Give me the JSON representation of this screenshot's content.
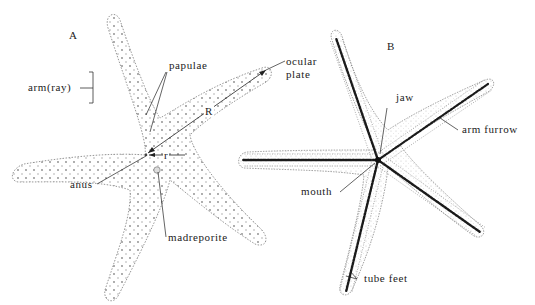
{
  "figure": {
    "panels": [
      {
        "id": "A",
        "label": "A",
        "view": "aboral (top) view of starfish",
        "annotations": {
          "arm": "arm(ray)",
          "papulae": "papulae",
          "ocular_plate": "ocular\nplate",
          "ocular_line1": "ocular",
          "ocular_line2": "plate",
          "R": "R",
          "r": "r",
          "anus": "anus",
          "madreporite": "madreporite"
        }
      },
      {
        "id": "B",
        "label": "B",
        "view": "oral (bottom) view of starfish",
        "annotations": {
          "jaw": "jaw",
          "arm_furrow": "arm furrow",
          "mouth": "mouth",
          "tube_feet": "tube feet"
        }
      }
    ],
    "colors": {
      "background": "#ffffff",
      "outline": "#8a8a8a",
      "ink": "#222222",
      "furrow": "#1a1a1a"
    }
  }
}
